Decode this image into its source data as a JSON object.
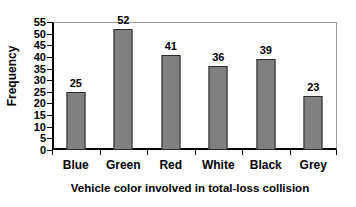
{
  "chart_data": {
    "type": "bar",
    "title": "",
    "categories": [
      "Blue",
      "Green",
      "Red",
      "White",
      "Black",
      "Grey"
    ],
    "values": [
      25,
      52,
      41,
      36,
      39,
      23
    ],
    "xlabel": "Vehicle color involved in total-loss collision",
    "ylabel": "Frequency",
    "ylim": [
      0,
      55
    ],
    "yticks": [
      0,
      5,
      10,
      15,
      20,
      25,
      30,
      35,
      40,
      45,
      50,
      55
    ],
    "ytick_labels": [
      "0",
      "5",
      "10",
      "15",
      "20",
      "25",
      "30",
      "35",
      "40",
      "45",
      "50",
      "55"
    ],
    "value_labels": [
      "25",
      "52",
      "41",
      "36",
      "39",
      "23"
    ],
    "grid": false,
    "legend": false,
    "bar_color": "#808080",
    "bar_border_color": "#2b2b2b",
    "axis_color": "#000000",
    "frame_color": "#9a9a9a",
    "text_color": "#000000",
    "background": "#ffffff"
  }
}
